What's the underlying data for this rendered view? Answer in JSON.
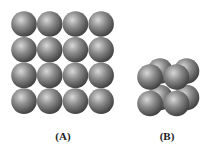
{
  "figure": {
    "panels": [
      {
        "id": "A",
        "label": "(A)",
        "description": "square 2D packing of spheres",
        "arrangement": "square-grid",
        "rows": 4,
        "cols": 4,
        "sphere_count": 16
      },
      {
        "id": "B",
        "label": "(B)",
        "description": "simple cubic unit cell of spheres",
        "arrangement": "cube",
        "layers": 2,
        "rows": 2,
        "cols": 2,
        "sphere_count": 8
      }
    ],
    "colors": {
      "sphere_highlight": "#d8d8d8",
      "sphere_mid": "#8a8a8a",
      "sphere_shadow": "#3c3c3c",
      "background": "#ffffff",
      "label": "#222222"
    }
  }
}
